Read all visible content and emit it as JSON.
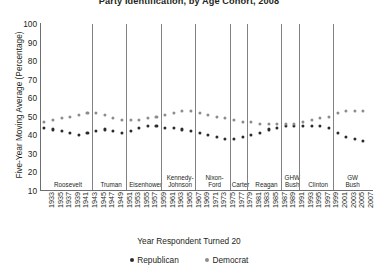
{
  "chart_data": {
    "type": "scatter",
    "title": "Party Identification, by Age Cohort, 2008",
    "xlabel": "Year Respondent Turned 20",
    "ylabel": "Five-Year Moving Average (Percentage)",
    "ylim": [
      0,
      100
    ],
    "yticks": [
      100,
      90,
      80,
      70,
      60,
      50,
      40,
      30,
      20,
      10
    ],
    "grid": false,
    "legend_position": "bottom-center",
    "x": [
      1933,
      1935,
      1937,
      1939,
      1941,
      1943,
      1945,
      1947,
      1949,
      1951,
      1953,
      1955,
      1957,
      1959,
      1961,
      1963,
      1965,
      1967,
      1969,
      1971,
      1973,
      1975,
      1977,
      1979,
      1981,
      1983,
      1985,
      1987,
      1989,
      1991,
      1993,
      1995,
      1997,
      1999,
      2001,
      2003,
      2005,
      2007
    ],
    "xticks": [
      1933,
      1935,
      1937,
      1939,
      1941,
      1943,
      1945,
      1947,
      1949,
      1951,
      1953,
      1955,
      1957,
      1959,
      1961,
      1963,
      1965,
      1967,
      1969,
      1971,
      1973,
      1975,
      1977,
      1979,
      1981,
      1983,
      1985,
      1987,
      1989,
      1991,
      1993,
      1995,
      1997,
      1999,
      2001,
      2003,
      2005,
      2007
    ],
    "series": [
      {
        "name": "Republican",
        "color": "#2b2b2b",
        "values": [
          44,
          43,
          42,
          41,
          40,
          41,
          42,
          43,
          42,
          41,
          42,
          44,
          45,
          45,
          44,
          44,
          43,
          42,
          41,
          40,
          39,
          38,
          38,
          39,
          40,
          41,
          43,
          44,
          45,
          45,
          45,
          45,
          45,
          44,
          41,
          39,
          38,
          37
        ]
      },
      {
        "name": "Democrat",
        "color": "#8c8c8c",
        "values": [
          47,
          48,
          49,
          50,
          51,
          52,
          52,
          51,
          49,
          48,
          48,
          48,
          49,
          50,
          51,
          52,
          53,
          53,
          52,
          51,
          50,
          49,
          48,
          47,
          47,
          46,
          46,
          46,
          46,
          46,
          47,
          48,
          49,
          50,
          52,
          53,
          53,
          53
        ]
      }
    ],
    "eras": [
      {
        "label": "Roosevelt",
        "start": 1933,
        "end": 1944
      },
      {
        "label": "Truman",
        "start": 1945,
        "end": 1952
      },
      {
        "label": "Eisenhower",
        "start": 1953,
        "end": 1960
      },
      {
        "label": "Kennedy-\nJohnson",
        "start": 1961,
        "end": 1968
      },
      {
        "label": "Nixon-\nFord",
        "start": 1969,
        "end": 1976
      },
      {
        "label": "Carter",
        "start": 1977,
        "end": 1980
      },
      {
        "label": "Reagan",
        "start": 1981,
        "end": 1988
      },
      {
        "label": "GHW\nBush",
        "start": 1989,
        "end": 1992
      },
      {
        "label": "Clinton",
        "start": 1993,
        "end": 2000
      },
      {
        "label": "GW\nBush",
        "start": 2001,
        "end": 2008
      }
    ],
    "legend": [
      {
        "label": "Republican",
        "color": "#2b2b2b"
      },
      {
        "label": "Democrat",
        "color": "#8c8c8c"
      }
    ]
  }
}
